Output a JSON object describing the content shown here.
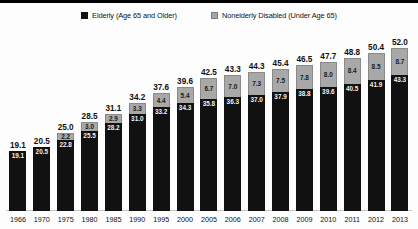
{
  "legend": {
    "items": [
      {
        "label": "Elderly (Age 65 and Older)",
        "swatch": "black",
        "color": "#111111"
      },
      {
        "label": "Nonelderly Disabled (Under Age 65)",
        "swatch": "gray",
        "color": "#a8a8a8"
      }
    ]
  },
  "chart_data": {
    "type": "bar",
    "subtype": "stacked-bar",
    "title": "",
    "xlabel": "",
    "ylabel": "",
    "ylim": [
      0,
      52.0
    ],
    "grid": false,
    "legend_position": "top-center",
    "categories": [
      "1966",
      "1970",
      "1975",
      "1980",
      "1985",
      "1990",
      "1995",
      "2000",
      "2005",
      "2006",
      "2007",
      "2008",
      "2009",
      "2010",
      "2011",
      "2012",
      "2013"
    ],
    "series": [
      {
        "name": "Elderly (Age 65 and Older)",
        "color": "#111111",
        "values": [
          19.1,
          20.5,
          22.8,
          25.5,
          28.2,
          31.0,
          33.2,
          34.3,
          35.8,
          36.3,
          37.0,
          37.9,
          38.8,
          39.6,
          40.5,
          41.9,
          43.3
        ]
      },
      {
        "name": "Nonelderly Disabled (Under Age 65)",
        "color": "#a8a8a8",
        "values": [
          null,
          null,
          2.2,
          3.0,
          2.9,
          3.3,
          4.4,
          5.4,
          6.7,
          7.0,
          7.3,
          7.5,
          7.8,
          8.0,
          8.4,
          8.5,
          8.7
        ]
      }
    ],
    "totals": [
      19.1,
      20.5,
      25.0,
      28.5,
      31.1,
      34.2,
      37.6,
      39.6,
      42.5,
      43.3,
      44.3,
      45.4,
      46.5,
      47.7,
      48.8,
      50.4,
      52.0
    ]
  }
}
